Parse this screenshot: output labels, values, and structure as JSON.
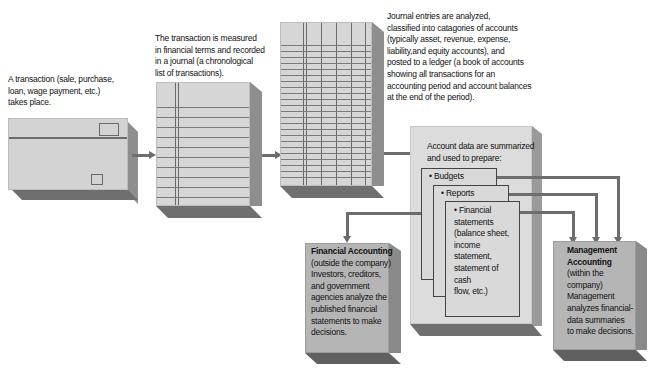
{
  "steps": {
    "transaction": {
      "text_lines": [
        "A transaction (sale, purchase,",
        "loan, wage payment, etc.)",
        "takes place."
      ]
    },
    "journal": {
      "text_lines": [
        "The transaction is measured",
        "in financial terms and recorded",
        "in a journal (a chronological",
        "list of transactions)."
      ]
    },
    "ledger": {
      "text_lines": [
        "Journal entries are analyzed,",
        "classified into catagories of accounts",
        "(typically asset, revenue, expense,",
        "liability,and equity accounts), and",
        "posted to a ledger (a book of accounts",
        "showing all transactions for an",
        "accounting period and account balances",
        "at the end of the period)."
      ]
    },
    "summary": {
      "text_lines": [
        "Account data are summarized",
        "and used to prepare:"
      ],
      "documents": [
        {
          "label": "• Budgets"
        },
        {
          "label": "• Reports"
        },
        {
          "label_lines": [
            "• Financial",
            "statements",
            "(balance sheet,",
            "income statement,",
            "statement of cash",
            "flow, etc.)"
          ]
        }
      ]
    },
    "financial_accounting": {
      "title": "Financial Accounting",
      "text_lines": [
        "(outside the company)",
        "Investors, creditors,",
        "and government",
        "agencies analyze the",
        "published financial",
        "statements to make",
        "decisions."
      ]
    },
    "management_accounting": {
      "title_lines": [
        "Management",
        "Accounting"
      ],
      "text_lines": [
        "(within the",
        "company)",
        "Management",
        "analyzes financial-",
        "data summaries",
        "to make decisions."
      ]
    }
  },
  "colors": {
    "face": "#d3d3d3",
    "side": "#8e8e8e",
    "bottom": "#6f6f6f",
    "arrow": "#6d6d6d"
  }
}
